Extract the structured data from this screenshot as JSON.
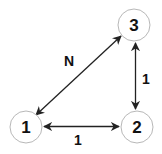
{
  "diagram": {
    "type": "graph",
    "nodes": [
      {
        "id": "1",
        "label": "1",
        "cx": 26,
        "cy": 127,
        "r": 16
      },
      {
        "id": "2",
        "label": "2",
        "cx": 137,
        "cy": 127,
        "r": 16
      },
      {
        "id": "3",
        "label": "3",
        "cx": 134,
        "cy": 25,
        "r": 16
      }
    ],
    "edges": [
      {
        "from": "1",
        "to": "3",
        "label": "N",
        "bidirectional": true
      },
      {
        "from": "2",
        "to": "3",
        "label": "1",
        "bidirectional": true
      },
      {
        "from": "1",
        "to": "2",
        "label": "1",
        "bidirectional": true
      }
    ]
  },
  "colors": {
    "node_stroke": "#b8b8b8",
    "edge": "#222222",
    "text": "#111111"
  }
}
